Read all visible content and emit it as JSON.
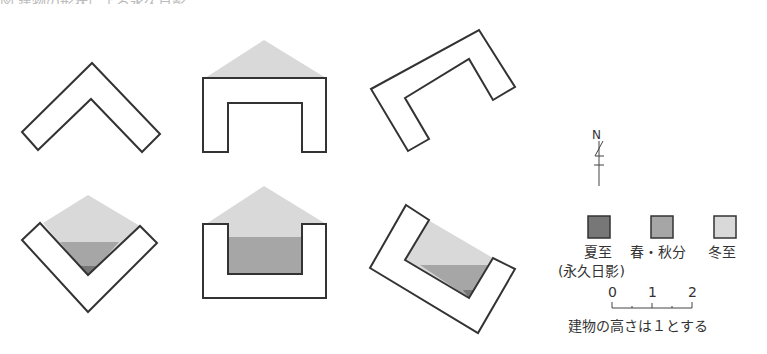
{
  "title": "図 建物の形状による永久日影",
  "compass": {
    "label": "N"
  },
  "legend": {
    "items": [
      {
        "label": "夏至",
        "sublabel": "(永久日影)",
        "color": "#777777"
      },
      {
        "label": "春・秋分",
        "color": "#a6a6a6"
      },
      {
        "label": "冬至",
        "color": "#d9d9d9"
      }
    ]
  },
  "scale": {
    "ticks": [
      "0",
      "1",
      "2"
    ],
    "note": "建物の高さは１とする"
  },
  "colors": {
    "outline": "#333333",
    "summer": "#777777",
    "equinox": "#a6a6a6",
    "winter": "#d9d9d9"
  },
  "diagrams": [
    {
      "shape": "L-chevron",
      "row": "top",
      "shadow": "none"
    },
    {
      "shape": "U-open-south",
      "row": "top",
      "shadow": "winter"
    },
    {
      "shape": "U-rotated",
      "row": "top",
      "shadow": "none"
    },
    {
      "shape": "V-chevron",
      "row": "bottom",
      "shadow": "winter+equinox+summer"
    },
    {
      "shape": "U-open-north",
      "row": "bottom",
      "shadow": "winter+equinox"
    },
    {
      "shape": "U-rotated-open-north",
      "row": "bottom",
      "shadow": "winter+equinox+summer"
    }
  ]
}
